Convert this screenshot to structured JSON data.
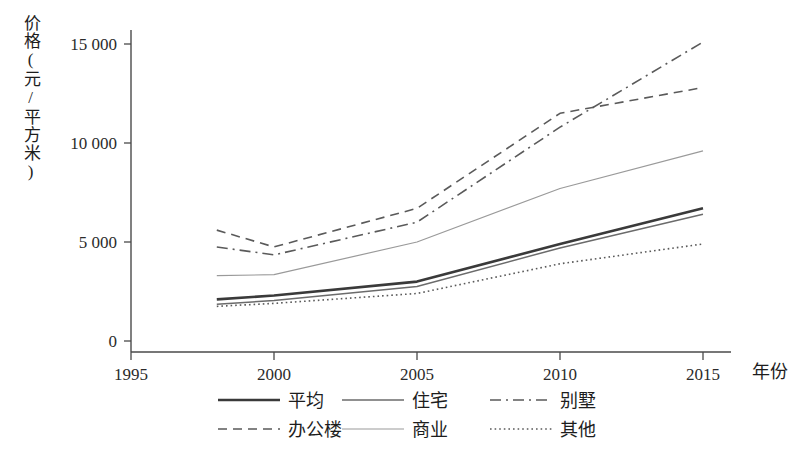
{
  "chart_data": {
    "type": "line",
    "title": "",
    "xlabel": "年份",
    "ylabel": "价格(元/平方米)",
    "x": [
      1998,
      2000,
      2005,
      2010,
      2015
    ],
    "xlim": [
      1995,
      2015
    ],
    "ylim": [
      0,
      16000
    ],
    "grid": false,
    "legend_position": "bottom",
    "xticks": [
      "1995",
      "2000",
      "2005",
      "2010",
      "2015"
    ],
    "xtick_values": [
      1995,
      2000,
      2005,
      2010,
      2015
    ],
    "yticks": [
      "0",
      "5 000",
      "10 000",
      "15 000"
    ],
    "ytick_values": [
      0,
      5000,
      10000,
      15000
    ],
    "series": [
      {
        "name": "平均",
        "style": "solid-thick",
        "color": "#3a3a3a",
        "values": [
          2100,
          2300,
          3000,
          4900,
          6700
        ]
      },
      {
        "name": "住宅",
        "style": "solid-thin",
        "color": "#6b6b6b",
        "values": [
          1850,
          2050,
          2750,
          4700,
          6400
        ]
      },
      {
        "name": "别墅",
        "style": "dash-dot",
        "color": "#5a5a5a",
        "values": [
          4750,
          4350,
          6000,
          10800,
          15100
        ]
      },
      {
        "name": "办公楼",
        "style": "dashed",
        "color": "#5a5a5a",
        "values": [
          5600,
          4750,
          6700,
          11500,
          12800
        ]
      },
      {
        "name": "商业",
        "style": "solid-light",
        "color": "#9a9a9a",
        "values": [
          3300,
          3350,
          5000,
          7700,
          9600
        ]
      },
      {
        "name": "其他",
        "style": "dotted",
        "color": "#5a5a5a",
        "values": [
          1750,
          1900,
          2400,
          3900,
          4900
        ]
      }
    ]
  },
  "legend": {
    "entries": [
      {
        "label": "平均",
        "style": "solid-thick"
      },
      {
        "label": "住宅",
        "style": "solid-thin"
      },
      {
        "label": "别墅",
        "style": "dash-dot"
      },
      {
        "label": "办公楼",
        "style": "dashed"
      },
      {
        "label": "商业",
        "style": "solid-light"
      },
      {
        "label": "其他",
        "style": "dotted"
      }
    ]
  }
}
